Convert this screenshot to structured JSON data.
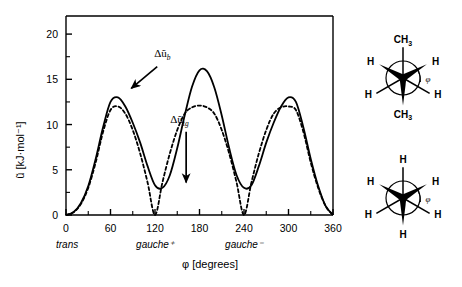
{
  "chart_data": {
    "type": "line",
    "title": "",
    "xlabel": "φ  [degrees]",
    "ylabel": "ũ [kJ·mol⁻¹]",
    "xlim": [
      0,
      360
    ],
    "ylim": [
      0,
      22
    ],
    "grid": false,
    "legend": "none",
    "x_ticks": [
      0,
      60,
      120,
      180,
      240,
      300,
      360
    ],
    "x_tick_labels": [
      "0",
      "60",
      "120",
      "180",
      "240",
      "300",
      "360"
    ],
    "x_minor_tick_interval": 30,
    "y_ticks": [
      0,
      5,
      10,
      15,
      20
    ],
    "y_tick_labels": [
      "0",
      "5",
      "10",
      "15",
      "20"
    ],
    "y_minor_tick_interval": 2.5,
    "conformer_labels": [
      {
        "text": "trans",
        "x": 0
      },
      {
        "text": "gauche⁺",
        "x": 120
      },
      {
        "text": "gauche⁻",
        "x": 240
      }
    ],
    "series": [
      {
        "name": "solid",
        "style": "solid",
        "color": "#000000",
        "x": [
          0,
          10,
          20,
          30,
          40,
          50,
          60,
          70,
          80,
          90,
          100,
          110,
          120,
          130,
          140,
          150,
          160,
          170,
          180,
          190,
          200,
          210,
          220,
          230,
          240,
          250,
          260,
          270,
          280,
          290,
          300,
          310,
          320,
          330,
          340,
          350,
          360
        ],
        "values": [
          0.0,
          0.3,
          1.3,
          3.2,
          6.2,
          9.7,
          12.5,
          13.0,
          12.0,
          10.2,
          8.0,
          5.4,
          3.3,
          3.0,
          4.4,
          7.4,
          11.0,
          14.2,
          16.0,
          15.9,
          14.1,
          11.0,
          7.4,
          4.4,
          3.0,
          3.3,
          5.4,
          8.0,
          10.2,
          12.0,
          13.0,
          12.5,
          9.7,
          6.2,
          3.2,
          1.0,
          0.0
        ]
      },
      {
        "name": "dashed",
        "style": "dashed",
        "color": "#000000",
        "x": [
          0,
          10,
          20,
          30,
          40,
          50,
          60,
          70,
          80,
          90,
          100,
          110,
          120,
          130,
          140,
          150,
          160,
          170,
          180,
          190,
          200,
          210,
          220,
          230,
          240,
          250,
          260,
          270,
          280,
          290,
          300,
          310,
          320,
          330,
          340,
          350,
          360
        ],
        "values": [
          0.0,
          0.3,
          1.2,
          3.0,
          5.8,
          9.2,
          11.6,
          12.0,
          11.2,
          9.4,
          6.8,
          3.6,
          0.0,
          3.6,
          6.8,
          9.4,
          11.2,
          11.9,
          12.1,
          11.9,
          11.2,
          9.4,
          6.8,
          3.6,
          0.0,
          3.6,
          6.8,
          9.4,
          11.2,
          11.9,
          12.0,
          11.6,
          9.2,
          5.8,
          3.0,
          1.0,
          0.0
        ]
      }
    ],
    "annotations": [
      {
        "name": "delta-u-b",
        "text": "Δũ",
        "subscript": "b",
        "label_x": 130,
        "label_y": 17.5,
        "arrow_from_x": 123,
        "arrow_from_y": 16.4,
        "arrow_to_x": 88,
        "arrow_to_y": 14.0
      },
      {
        "name": "delta-u-tg",
        "text": "Δũ",
        "subscript": "tg",
        "label_x": 153,
        "label_y": 10.2,
        "arrow_from_x": 162,
        "arrow_from_y": 9.2,
        "arrow_to_x": 162,
        "arrow_to_y": 3.6
      }
    ]
  },
  "newman_diagrams": [
    {
      "name": "butane-newman-projection",
      "top_atom": "CH",
      "top_sub": "3",
      "bottom_atom": "CH",
      "bottom_sub": "3",
      "front_left": "H",
      "front_right": "H",
      "back_left": "H",
      "back_right": "H",
      "angle_symbol": "φ"
    },
    {
      "name": "ethane-newman-projection",
      "top_atom": "H",
      "top_sub": "",
      "bottom_atom": "H",
      "bottom_sub": "",
      "front_left": "H",
      "front_right": "H",
      "back_left": "H",
      "back_right": "H",
      "angle_symbol": "φ"
    }
  ],
  "colors": {
    "curve": "#000000",
    "axis": "#000000",
    "background": "#ffffff"
  }
}
